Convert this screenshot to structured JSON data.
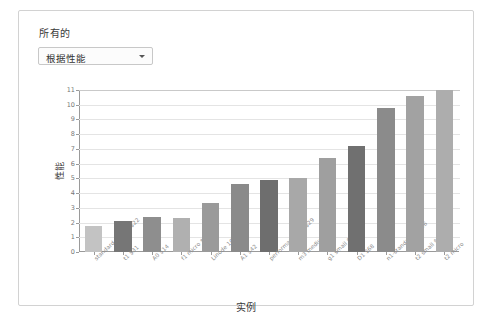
{
  "panel": {
    "title": "所有的"
  },
  "filter": {
    "selected": "根据性能",
    "caret_icon": "chevron-down-icon"
  },
  "chart_data": {
    "type": "bar",
    "title": "",
    "xlabel": "实例",
    "ylabel": "性能",
    "ylim": [
      0,
      11
    ],
    "yticks": [
      0,
      1,
      2,
      3,
      4,
      5,
      6,
      7,
      8,
      9,
      10,
      11
    ],
    "grid": true,
    "legend": "none",
    "categories": [
      "standard-xsmall $22",
      "t1 $31",
      "A0 $14",
      "f1 micro $9",
      "Linode 1GB $11",
      "A1 $42",
      "performance1-1 $29",
      "m3 medium $50",
      "g1 small $23",
      "D1 $68",
      "n1-standard-1 $46",
      "t2 small $19",
      "t2 micro"
    ],
    "values": [
      1.8,
      2.1,
      2.4,
      2.3,
      3.3,
      4.6,
      4.9,
      5.0,
      6.4,
      7.2,
      9.8,
      10.6,
      11.0
    ],
    "bar_colors": [
      "#c3c3c3",
      "#767676",
      "#8e8e8e",
      "#b0b0b0",
      "#9a9a9a",
      "#8a8a8a",
      "#6e6e6e",
      "#a8a8a8",
      "#9f9f9f",
      "#707070",
      "#8b8b8b",
      "#a2a2a2",
      "#adadad"
    ]
  }
}
